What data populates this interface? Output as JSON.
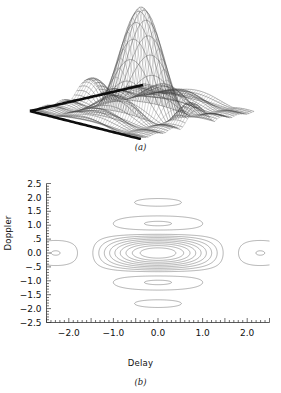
{
  "figure": {
    "panels": [
      {
        "id": "a",
        "caption": "(a)",
        "type": "surface-mesh"
      },
      {
        "id": "b",
        "caption": "(b)",
        "type": "contour"
      }
    ]
  },
  "panel_a": {
    "caption": "(a)",
    "description": "three-dimensional mesh surface plot of an ambiguity function with a tall central peak and decaying side lobes",
    "mesh_color": "#2b2b2b",
    "base_color": "#111111"
  },
  "panel_b": {
    "caption": "(b)",
    "xlabel": "Delay",
    "ylabel": "Doppler",
    "axis_color": "#333333",
    "contour_color": "#555555"
  },
  "chart_data": {
    "type": "contour",
    "title": "",
    "subtitle": "",
    "xlabel": "Delay",
    "ylabel": "Doppler",
    "xlim": [
      -2.5,
      2.5
    ],
    "ylim": [
      -2.5,
      2.5
    ],
    "grid": false,
    "legend": null,
    "xticks": [
      -2.5,
      -2.0,
      -1.5,
      -1.0,
      -0.5,
      0.0,
      0.5,
      1.0,
      1.5,
      2.0,
      2.5
    ],
    "xtick_labels": [
      "",
      "-2.0",
      "",
      "-1.0",
      "",
      "0.0",
      "",
      "1.0",
      "",
      "2.0",
      ""
    ],
    "yticks": [
      2.5,
      2.0,
      1.5,
      1.0,
      0.5,
      0.0,
      -0.5,
      -1.0,
      -1.5,
      -2.0,
      -2.5
    ],
    "ytick_labels": [
      "2.5",
      "2.0",
      "1.5",
      "1.0",
      ".5",
      "0.0",
      "-.5",
      "-1.0",
      "-1.5",
      "-2.0",
      "-2.5"
    ],
    "minor_tick_step": 0.1,
    "levels": [
      0.1,
      0.2,
      0.3,
      0.4,
      0.5,
      0.6,
      0.7,
      0.8,
      0.9
    ],
    "n_contours": 11,
    "features": [
      {
        "name": "central-lobe",
        "center": [
          0.0,
          0.0
        ],
        "shape": "nested concentric ellipses elongated along Delay"
      },
      {
        "name": "upper-sidelobe-ridge",
        "center": [
          0.0,
          1.3
        ],
        "shape": "concave arc opening downward"
      },
      {
        "name": "lower-sidelobe-ridge",
        "center": [
          0.0,
          -1.3
        ],
        "shape": "concave arc opening upward"
      },
      {
        "name": "small-closed-lobe-upper",
        "center": [
          0.0,
          0.7
        ],
        "shape": "small flat ellipse"
      },
      {
        "name": "small-closed-lobe-lower",
        "center": [
          0.0,
          -0.7
        ],
        "shape": "small flat ellipse"
      },
      {
        "name": "left-outer-wing",
        "center": [
          -1.8,
          0.0
        ],
        "shape": "hourglass wing"
      },
      {
        "name": "right-outer-wing",
        "center": [
          1.8,
          0.0
        ],
        "shape": "hourglass wing"
      }
    ],
    "secondary": {
      "type": "surface",
      "panel": "a",
      "description": "same ambiguity function rendered as a wireframe mesh surface",
      "peak_value": 1.0,
      "peak_location": [
        0.0,
        0.0
      ]
    }
  }
}
